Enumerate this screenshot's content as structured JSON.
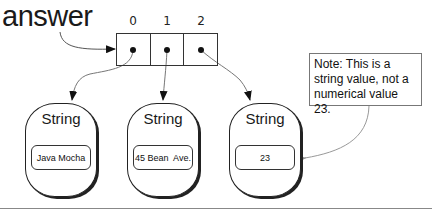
{
  "variable": {
    "name": "answer"
  },
  "array": {
    "indices": [
      "0",
      "1",
      "2"
    ]
  },
  "objects": [
    {
      "type": "String",
      "value": "Java Mocha"
    },
    {
      "type": "String",
      "value": "45 Bean  Ave."
    },
    {
      "type": "String",
      "value": "23"
    }
  ],
  "note": {
    "text": "Note: This is a string value, not a numerical value 23."
  }
}
